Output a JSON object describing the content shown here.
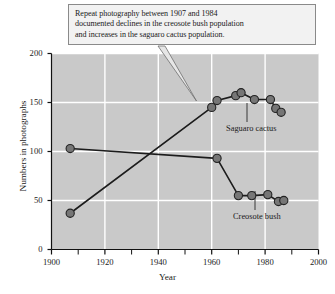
{
  "callout": {
    "lines": [
      "Repeat photography between 1907 and 1984",
      "documented declines in the creosote bush population",
      "and increases in the saguaro cactus population."
    ]
  },
  "chart_data": {
    "type": "scatter",
    "title": "",
    "xlabel": "Year",
    "ylabel": "Numbers in photographs",
    "xlim": [
      1900,
      2000
    ],
    "ylim": [
      0,
      200
    ],
    "xticks": [
      1900,
      1920,
      1940,
      1960,
      1980,
      2000
    ],
    "xticklabels": [
      "1900",
      "1920",
      "1940",
      "1960",
      "1980",
      "2000"
    ],
    "xminorticks": [
      1910,
      1930,
      1950,
      1970,
      1990
    ],
    "yticks": [
      0,
      50,
      100,
      150,
      200
    ],
    "yticklabels": [
      "0",
      "50",
      "100",
      "150",
      "200"
    ],
    "grid": true,
    "grid_color": "#ffffff",
    "plot_bgcolor": "#c9c9c9",
    "marker_color": "#767676",
    "marker_edge_color": "#232323",
    "line_color": "#1c1c1c",
    "legend": "annotated-labels",
    "series": [
      {
        "name": "Saguaro cactus",
        "label": "Saguaro cactus",
        "points": [
          {
            "x": 1907,
            "y": 37
          },
          {
            "x": 1960,
            "y": 145
          },
          {
            "x": 1962,
            "y": 152
          },
          {
            "x": 1969,
            "y": 157
          },
          {
            "x": 1971,
            "y": 160
          },
          {
            "x": 1976,
            "y": 153
          },
          {
            "x": 1982,
            "y": 153
          },
          {
            "x": 1984,
            "y": 144
          },
          {
            "x": 1986,
            "y": 140
          }
        ]
      },
      {
        "name": "Creosote bush",
        "label": "Creosote bush",
        "points": [
          {
            "x": 1907,
            "y": 103
          },
          {
            "x": 1962,
            "y": 93
          },
          {
            "x": 1970,
            "y": 55
          },
          {
            "x": 1975,
            "y": 55
          },
          {
            "x": 1981,
            "y": 56
          },
          {
            "x": 1985,
            "y": 49
          },
          {
            "x": 1987,
            "y": 50
          }
        ]
      }
    ]
  }
}
